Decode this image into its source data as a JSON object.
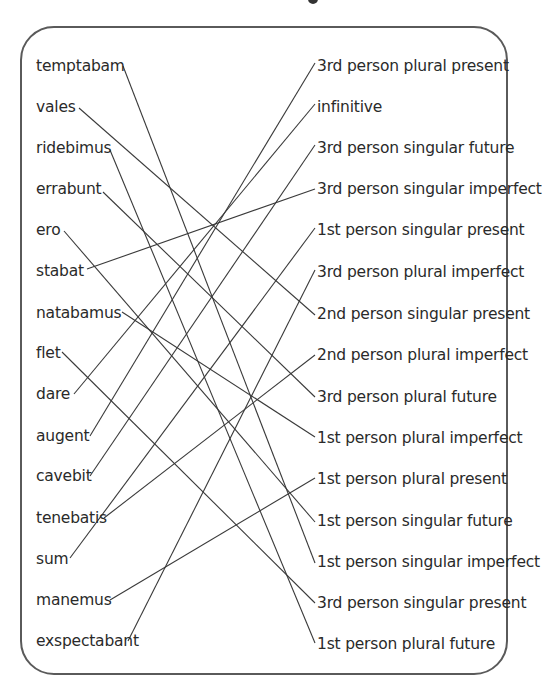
{
  "title_fragment": "g",
  "left_words": [
    {
      "label": "temptabam",
      "y": 57
    },
    {
      "label": "vales",
      "y": 98
    },
    {
      "label": "ridebimus",
      "y": 139
    },
    {
      "label": "errabunt",
      "y": 180
    },
    {
      "label": "ero",
      "y": 221
    },
    {
      "label": "stabat",
      "y": 262
    },
    {
      "label": "natabamus",
      "y": 304
    },
    {
      "label": "flet",
      "y": 344
    },
    {
      "label": "dare",
      "y": 385
    },
    {
      "label": "augent",
      "y": 427
    },
    {
      "label": "cavebit",
      "y": 467
    },
    {
      "label": "tenebatis",
      "y": 509
    },
    {
      "label": "sum",
      "y": 550
    },
    {
      "label": "manemus",
      "y": 591
    },
    {
      "label": "exspectabant",
      "y": 632
    }
  ],
  "right_forms": [
    {
      "label": "3rd person plural present",
      "y": 57
    },
    {
      "label": "infinitive",
      "y": 98
    },
    {
      "label": "3rd person singular future",
      "y": 139
    },
    {
      "label": "3rd person singular imperfect",
      "y": 180
    },
    {
      "label": "1st person singular present",
      "y": 221
    },
    {
      "label": "3rd person plural imperfect",
      "y": 263
    },
    {
      "label": "2nd person singular present",
      "y": 305
    },
    {
      "label": "2nd person plural imperfect",
      "y": 346
    },
    {
      "label": "3rd person plural future",
      "y": 388
    },
    {
      "label": "1st person plural imperfect",
      "y": 429
    },
    {
      "label": "1st person plural present",
      "y": 470
    },
    {
      "label": "1st person singular future",
      "y": 512
    },
    {
      "label": "1st person singular imperfect",
      "y": 553
    },
    {
      "label": "3rd person singular present",
      "y": 594
    },
    {
      "label": "1st person plural future",
      "y": 635
    }
  ],
  "left_anchor": [
    [
      123,
      66
    ],
    [
      79,
      108
    ],
    [
      110,
      150
    ],
    [
      103,
      192
    ],
    [
      64,
      231
    ],
    [
      87,
      269
    ],
    [
      122,
      312
    ],
    [
      62,
      352
    ],
    [
      74,
      394
    ],
    [
      90,
      436
    ],
    [
      90,
      476
    ],
    [
      104,
      518
    ],
    [
      70,
      558
    ],
    [
      110,
      600
    ],
    [
      128,
      641
    ]
  ],
  "right_anchor": [
    [
      315,
      63
    ],
    [
      315,
      104
    ],
    [
      315,
      145
    ],
    [
      315,
      189
    ],
    [
      315,
      228
    ],
    [
      315,
      270
    ],
    [
      315,
      315
    ],
    [
      315,
      355
    ],
    [
      315,
      397
    ],
    [
      315,
      437
    ],
    [
      315,
      478
    ],
    [
      315,
      522
    ],
    [
      315,
      563
    ],
    [
      315,
      603
    ],
    [
      315,
      643
    ]
  ],
  "connections": [
    {
      "word": "temptabam",
      "form": "1st person singular imperfect",
      "from": 0,
      "to": 12
    },
    {
      "word": "vales",
      "form": "2nd person singular present",
      "from": 1,
      "to": 6
    },
    {
      "word": "ridebimus",
      "form": "1st person plural future",
      "from": 2,
      "to": 14
    },
    {
      "word": "errabunt",
      "form": "3rd person plural future",
      "from": 3,
      "to": 8
    },
    {
      "word": "ero",
      "form": "1st person singular future",
      "from": 4,
      "to": 11
    },
    {
      "word": "stabat",
      "form": "3rd person singular imperfect",
      "from": 5,
      "to": 3
    },
    {
      "word": "natabamus",
      "form": "1st person plural imperfect",
      "from": 6,
      "to": 9
    },
    {
      "word": "flet",
      "form": "3rd person singular present",
      "from": 7,
      "to": 13
    },
    {
      "word": "dare",
      "form": "infinitive",
      "from": 8,
      "to": 1
    },
    {
      "word": "augent",
      "form": "3rd person plural present",
      "from": 9,
      "to": 0
    },
    {
      "word": "cavebit",
      "form": "3rd person singular future",
      "from": 10,
      "to": 2
    },
    {
      "word": "tenebatis",
      "form": "2nd person plural imperfect",
      "from": 11,
      "to": 7
    },
    {
      "word": "sum",
      "form": "1st person singular present",
      "from": 12,
      "to": 4
    },
    {
      "word": "manemus",
      "form": "1st person plural present",
      "from": 13,
      "to": 10
    },
    {
      "word": "exspectabant",
      "form": "3rd person plural imperfect",
      "from": 14,
      "to": 5
    }
  ],
  "colors": {
    "line": "#3a3a3a",
    "frame": "#5a5a5a",
    "text": "#2a2a2a"
  }
}
